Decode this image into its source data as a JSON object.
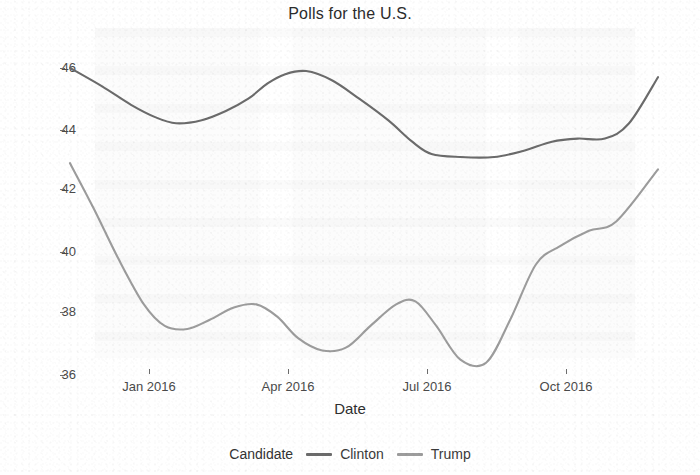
{
  "chart_data": {
    "type": "line",
    "title": "Polls for the U.S.",
    "xlabel": "Date",
    "ylabel": "",
    "grid": false,
    "legend_position": "bottom",
    "legend_title": "Candidate",
    "xlim": [
      "2015-11-20",
      "2016-11-20"
    ],
    "ylim": [
      35.6,
      46.6
    ],
    "yticks": [
      36,
      38,
      40,
      42,
      44,
      46
    ],
    "ytick_labels": [
      "36",
      "38",
      "40",
      "42",
      "44",
      "46"
    ],
    "xticks": [
      "2016-01-01",
      "2016-04-01",
      "2016-07-01",
      "2016-10-01"
    ],
    "xtick_labels": [
      "Jan 2016",
      "Apr 2016",
      "Jul 2016",
      "Oct 2016"
    ],
    "series": [
      {
        "name": "Clinton",
        "color": "#6b6b6b",
        "x": [
          "2015-11-20",
          "2015-12-10",
          "2015-12-28",
          "2016-01-12",
          "2016-01-25",
          "2016-02-10",
          "2016-02-25",
          "2016-03-10",
          "2016-03-22",
          "2016-04-02",
          "2016-04-15",
          "2016-05-01",
          "2016-05-18",
          "2016-06-05",
          "2016-06-20",
          "2016-07-02",
          "2016-07-20",
          "2016-08-10",
          "2016-08-28",
          "2016-09-15",
          "2016-10-01",
          "2016-10-18",
          "2016-11-02",
          "2016-11-20"
        ],
        "values": [
          46.0,
          45.4,
          44.8,
          44.4,
          44.2,
          44.3,
          44.6,
          45.0,
          45.5,
          45.8,
          45.9,
          45.6,
          45.0,
          44.3,
          43.6,
          43.2,
          43.1,
          43.1,
          43.3,
          43.6,
          43.7,
          43.7,
          44.2,
          45.7
        ]
      },
      {
        "name": "Trump",
        "color": "#9c9c9c",
        "x": [
          "2015-11-20",
          "2015-12-05",
          "2015-12-20",
          "2016-01-05",
          "2016-01-18",
          "2016-02-01",
          "2016-02-15",
          "2016-03-01",
          "2016-03-15",
          "2016-03-28",
          "2016-04-10",
          "2016-04-25",
          "2016-05-10",
          "2016-05-25",
          "2016-06-10",
          "2016-06-22",
          "2016-07-05",
          "2016-07-20",
          "2016-08-05",
          "2016-08-20",
          "2016-09-05",
          "2016-09-20",
          "2016-10-08",
          "2016-10-25",
          "2016-11-20"
        ],
        "values": [
          42.9,
          41.4,
          39.8,
          38.3,
          37.6,
          37.5,
          37.8,
          38.2,
          38.3,
          37.9,
          37.2,
          36.8,
          36.9,
          37.6,
          38.3,
          38.4,
          37.6,
          36.5,
          36.4,
          37.8,
          39.6,
          40.2,
          40.7,
          41.0,
          42.7
        ]
      }
    ]
  }
}
